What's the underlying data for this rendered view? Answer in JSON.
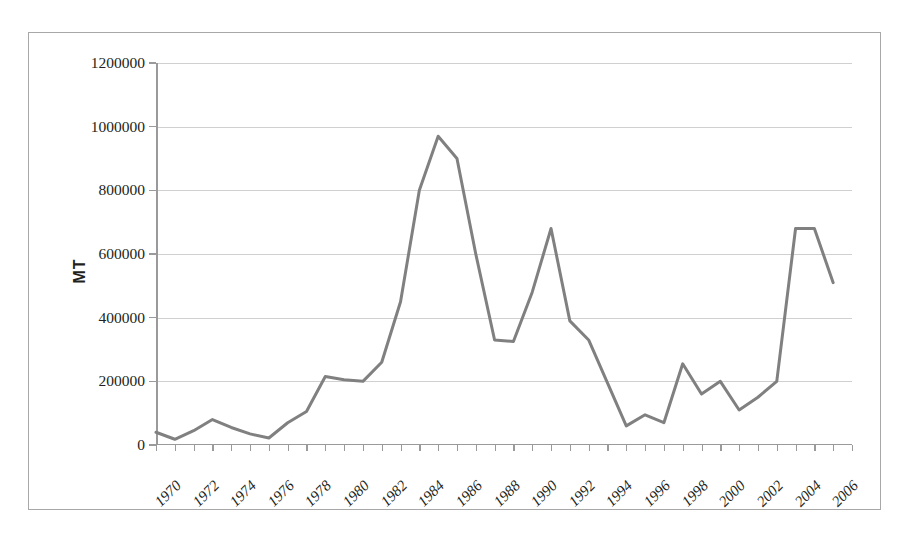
{
  "chart_data": {
    "type": "line",
    "title": "",
    "xlabel": "",
    "ylabel": "MT",
    "ylim": [
      0,
      1200000
    ],
    "xlim": [
      1970,
      2007
    ],
    "grid": true,
    "legend": false,
    "line_color": "#808080",
    "axis_color": "#9a9a9a",
    "grid_color": "#d0d0d0",
    "ytick_labels": [
      "0",
      "200000",
      "400000",
      "600000",
      "800000",
      "1000000",
      "1200000"
    ],
    "ytick_values": [
      0,
      200000,
      400000,
      600000,
      800000,
      1000000,
      1200000
    ],
    "xtick_labels": [
      "1970",
      "1972",
      "1974",
      "1976",
      "1978",
      "1980",
      "1982",
      "1984",
      "1986",
      "1988",
      "1990",
      "1992",
      "1994",
      "1996",
      "1998",
      "2000",
      "2002",
      "2004",
      "2006"
    ],
    "x": [
      1970,
      1971,
      1972,
      1973,
      1974,
      1975,
      1976,
      1977,
      1978,
      1979,
      1980,
      1981,
      1982,
      1983,
      1984,
      1985,
      1986,
      1987,
      1988,
      1989,
      1990,
      1991,
      1992,
      1993,
      1994,
      1995,
      1996,
      1997,
      1998,
      1999,
      2000,
      2001,
      2002,
      2003,
      2004,
      2005,
      2006
    ],
    "values": [
      40000,
      18000,
      45000,
      80000,
      55000,
      35000,
      22000,
      70000,
      105000,
      215000,
      205000,
      200000,
      260000,
      450000,
      800000,
      970000,
      900000,
      600000,
      330000,
      325000,
      480000,
      680000,
      390000,
      330000,
      195000,
      60000,
      95000,
      70000,
      255000,
      160000,
      200000,
      110000,
      150000,
      200000,
      680000,
      680000,
      510000
    ],
    "series_name": "MT"
  }
}
